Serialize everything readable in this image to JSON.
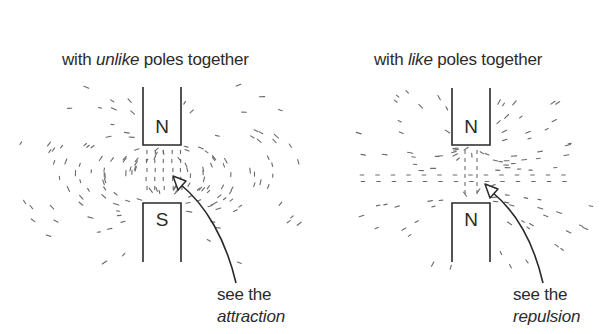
{
  "panels": [
    {
      "id": "unlike",
      "title": {
        "prefix": "with ",
        "emphasis": "unlike",
        "suffix": " poles together"
      },
      "magnets": [
        {
          "label": "N",
          "position": "top"
        },
        {
          "label": "S",
          "position": "bottom"
        }
      ],
      "caption": {
        "line1": "see the",
        "line2": "attraction"
      },
      "field_type": "attraction"
    },
    {
      "id": "like",
      "title": {
        "prefix": "with ",
        "emphasis": "like",
        "suffix": " poles together"
      },
      "magnets": [
        {
          "label": "N",
          "position": "top"
        },
        {
          "label": "N",
          "position": "bottom"
        }
      ],
      "caption": {
        "line1": "see the",
        "line2": "repulsion"
      },
      "field_type": "repulsion"
    }
  ],
  "colors": {
    "ink": "#2a2a2a",
    "filings": "#6a6a6a",
    "background": "#ffffff"
  }
}
